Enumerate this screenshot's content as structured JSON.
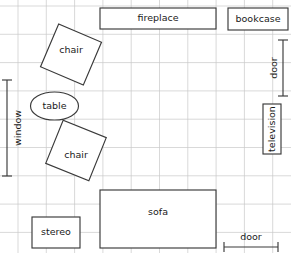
{
  "diagram": {
    "type": "floor-plan",
    "canvas": {
      "width": 291,
      "height": 253
    },
    "grid": {
      "visible": true,
      "color": "#c9c9c9",
      "spacing": 28.3,
      "origin_x": 18,
      "origin_y": 6,
      "columns": 9,
      "rows": 8
    },
    "colors": {
      "grid": "#c9c9c9",
      "outline": "#3a3a3a",
      "fill": "#ffffff",
      "text": "#1a1a1a"
    },
    "furniture": [
      {
        "id": "fireplace",
        "label": "fireplace",
        "shape": "rect",
        "x": 100,
        "y": 8,
        "width": 116,
        "height": 21,
        "rotation": 0,
        "label_x": 158,
        "label_y": 18.5,
        "orientation": "horizontal"
      },
      {
        "id": "bookcase",
        "label": "bookcase",
        "shape": "rect",
        "x": 228,
        "y": 8,
        "width": 60,
        "height": 22,
        "rotation": 0,
        "label_x": 258,
        "label_y": 19,
        "orientation": "horizontal"
      },
      {
        "id": "television",
        "label": "television",
        "shape": "rect",
        "x": 263,
        "y": 104,
        "width": 18,
        "height": 50,
        "rotation": 0,
        "label_x": 272,
        "label_y": 129,
        "orientation": "vertical-up"
      },
      {
        "id": "chair-top",
        "label": "chair",
        "shape": "square-rotated",
        "center_x": 71,
        "center_y": 54.5,
        "size": 46.5,
        "rotation": 23,
        "label_x": 71,
        "label_y": 50
      },
      {
        "id": "table",
        "label": "table",
        "shape": "ellipse",
        "center_x": 54.5,
        "center_y": 106,
        "rx": 24,
        "ry": 14,
        "rotation": 0,
        "label_x": 54.5,
        "label_y": 106
      },
      {
        "id": "chair-bottom",
        "label": "chair",
        "shape": "square-rotated",
        "center_x": 76,
        "center_y": 150.5,
        "size": 46.5,
        "rotation": 22,
        "label_x": 76,
        "label_y": 155
      },
      {
        "id": "sofa",
        "label": "sofa",
        "shape": "rect",
        "x": 100,
        "y": 190,
        "width": 116,
        "height": 58,
        "rotation": 0,
        "label_x": 158,
        "label_y": 212,
        "orientation": "horizontal"
      },
      {
        "id": "stereo",
        "label": "stereo",
        "shape": "rect",
        "x": 32,
        "y": 217,
        "width": 48,
        "height": 31,
        "rotation": 0,
        "label_x": 56,
        "label_y": 232,
        "orientation": "horizontal"
      }
    ],
    "openings": [
      {
        "id": "window-left",
        "label": "window",
        "orientation": "vertical-up",
        "line_x": 7,
        "start": 80,
        "end": 176,
        "tick_half": 5,
        "label_x": 18,
        "label_y": 128
      },
      {
        "id": "door-right",
        "label": "door",
        "orientation": "vertical-up",
        "line_x": 283,
        "start": 40,
        "end": 96,
        "tick_half": 5,
        "label_x": 274,
        "label_y": 68
      },
      {
        "id": "door-bottom",
        "label": "door",
        "orientation": "horizontal",
        "line_y": 247,
        "start": 224,
        "end": 278,
        "tick_half": 5,
        "label_x": 251,
        "label_y": 237
      }
    ]
  }
}
